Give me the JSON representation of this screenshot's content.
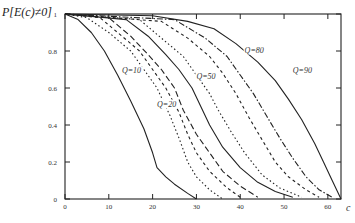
{
  "chart_data": {
    "type": "line",
    "title": "",
    "xlabel": "c",
    "ylabel": "P[E(c)≠0]",
    "xlim": [
      0,
      63
    ],
    "ylim": [
      0,
      1
    ],
    "xticks": [
      0,
      10,
      20,
      30,
      40,
      50,
      60
    ],
    "yticks": [
      0,
      0.2,
      0.4,
      0.6,
      0.8,
      1
    ],
    "grid": false,
    "legend": "inline labels",
    "series": [
      {
        "name": "Q=10",
        "style": "solid",
        "x": [
          0,
          3,
          6,
          9,
          12,
          15,
          18,
          20,
          21,
          23,
          25,
          28,
          30
        ],
        "y": [
          1,
          0.97,
          0.9,
          0.8,
          0.67,
          0.53,
          0.38,
          0.25,
          0.17,
          0.12,
          0.08,
          0.03,
          0.0
        ]
      },
      {
        "name": "Q=20",
        "style": "dotted",
        "x": [
          0,
          5,
          10,
          15,
          18,
          21,
          24,
          26,
          28,
          30,
          33,
          36
        ],
        "y": [
          1,
          0.98,
          0.9,
          0.8,
          0.7,
          0.6,
          0.45,
          0.33,
          0.2,
          0.12,
          0.05,
          0.0
        ]
      },
      {
        "name": "Q=30",
        "style": "dashed",
        "x": [
          0,
          8,
          13,
          17,
          20,
          23,
          26,
          28,
          30,
          33,
          37,
          40
        ],
        "y": [
          1,
          0.98,
          0.88,
          0.8,
          0.7,
          0.6,
          0.47,
          0.35,
          0.25,
          0.15,
          0.06,
          0.01
        ]
      },
      {
        "name": "Q=40",
        "style": "longdash",
        "x": [
          0,
          10,
          15,
          19,
          22,
          25,
          27,
          30,
          33,
          36,
          40,
          44
        ],
        "y": [
          1,
          0.98,
          0.88,
          0.78,
          0.7,
          0.6,
          0.48,
          0.35,
          0.25,
          0.15,
          0.07,
          0.01
        ]
      },
      {
        "name": "Q=50",
        "style": "solid",
        "x": [
          0,
          14,
          19,
          23,
          26,
          29,
          31,
          33,
          36,
          40,
          44,
          48,
          52
        ],
        "y": [
          1,
          0.97,
          0.88,
          0.78,
          0.7,
          0.6,
          0.5,
          0.4,
          0.28,
          0.17,
          0.09,
          0.04,
          0.01
        ]
      },
      {
        "name": "Q=60",
        "style": "dotted",
        "x": [
          0,
          17,
          22,
          27,
          30,
          33,
          35,
          38,
          41,
          45,
          49,
          54
        ],
        "y": [
          1,
          0.97,
          0.87,
          0.77,
          0.67,
          0.57,
          0.48,
          0.36,
          0.25,
          0.13,
          0.06,
          0.01
        ]
      },
      {
        "name": "Q=70",
        "style": "dashed",
        "x": [
          0,
          22,
          28,
          33,
          36,
          39,
          42,
          45,
          48,
          51,
          55,
          58
        ],
        "y": [
          1,
          0.96,
          0.87,
          0.77,
          0.68,
          0.57,
          0.44,
          0.32,
          0.2,
          0.12,
          0.05,
          0.01
        ]
      },
      {
        "name": "Q=80",
        "style": "dashdot",
        "x": [
          0,
          25,
          32,
          37,
          40,
          43,
          46,
          49,
          52,
          55,
          58,
          61
        ],
        "y": [
          1,
          0.97,
          0.87,
          0.77,
          0.67,
          0.57,
          0.45,
          0.33,
          0.22,
          0.12,
          0.05,
          0.01
        ]
      },
      {
        "name": "Q=90",
        "style": "solid",
        "x": [
          0,
          20,
          28,
          34,
          39,
          44,
          48,
          51,
          54,
          57,
          59,
          61,
          63
        ],
        "y": [
          1,
          0.99,
          0.96,
          0.92,
          0.84,
          0.74,
          0.64,
          0.54,
          0.43,
          0.3,
          0.2,
          0.1,
          0.0
        ]
      }
    ],
    "annotations": [
      {
        "text": "Q=10",
        "x": 13,
        "y": 0.68
      },
      {
        "text": "Q=20",
        "x": 21,
        "y": 0.5
      },
      {
        "text": "Q=50",
        "x": 30,
        "y": 0.65
      },
      {
        "text": "Q=80",
        "x": 41,
        "y": 0.79
      },
      {
        "text": "Q=90",
        "x": 52,
        "y": 0.68
      }
    ]
  },
  "labels": {
    "ylabel": "P[E(c)≠0]",
    "xlabel": "c"
  }
}
